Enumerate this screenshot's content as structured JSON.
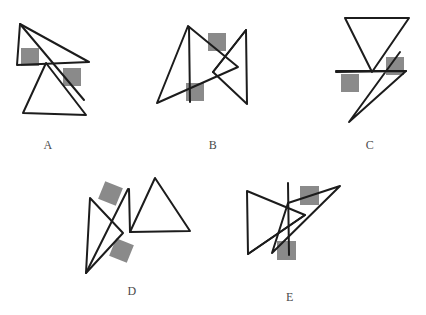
{
  "page": {
    "background_color": "#ffffff",
    "width": 426,
    "height": 315
  },
  "style": {
    "stroke_color": "#1c1c1c",
    "stroke_width": 2,
    "square_fill": "#8a8a8a",
    "label_color": "#4a4a4a"
  },
  "figures": [
    {
      "id": "A",
      "label": "A",
      "label_x": 38,
      "label_y": 138,
      "origin_x": 0,
      "origin_y": 0,
      "squares": [
        {
          "name": "square-upper-left",
          "x": 21,
          "y": 48,
          "size": 18,
          "rotation": 0
        },
        {
          "name": "square-lower-right",
          "x": 63,
          "y": 68,
          "size": 18,
          "rotation": 0
        }
      ],
      "strokes": [
        {
          "name": "upper-triangle",
          "points": "20,24 89,62 17,65 20,24"
        },
        {
          "name": "lower-triangle",
          "points": "46,63 23,113 86,115 46,63"
        },
        {
          "name": "long-diagonal",
          "points": "20,24 84,100"
        }
      ]
    },
    {
      "id": "B",
      "label": "B",
      "label_x": 207,
      "label_y": 138,
      "origin_x": 0,
      "origin_y": 0,
      "squares": [
        {
          "name": "square-upper",
          "x": 208,
          "y": 33,
          "size": 18,
          "rotation": 0
        },
        {
          "name": "square-lower",
          "x": 186,
          "y": 83,
          "size": 18,
          "rotation": 0
        }
      ],
      "strokes": [
        {
          "name": "left-triangle",
          "points": "188,26 157,103 238,67 188,26"
        },
        {
          "name": "right-triangle",
          "points": "246,30 213,72 247,104 246,30"
        },
        {
          "name": "vertical-line",
          "points": "189,27 190,102"
        },
        {
          "name": "right-upper-edge",
          "points": "213,72 246,30"
        }
      ]
    },
    {
      "id": "C",
      "label": "C",
      "label_x": 363,
      "label_y": 138,
      "origin_x": 0,
      "origin_y": 0,
      "squares": [
        {
          "name": "square-right",
          "x": 386,
          "y": 57,
          "size": 18,
          "rotation": 0
        },
        {
          "name": "square-left",
          "x": 341,
          "y": 74,
          "size": 18,
          "rotation": 0
        }
      ],
      "strokes": [
        {
          "name": "inverted-triangle",
          "points": "345,18 409,18 372,72 345,18"
        },
        {
          "name": "zigzag-lower",
          "points": "400,52 349,122 406,71 336,72"
        },
        {
          "name": "horizontal-line",
          "points": "336,71 406,71"
        }
      ]
    },
    {
      "id": "D",
      "label": "D",
      "label_x": 126,
      "label_y": 284,
      "origin_x": 0,
      "origin_y": 0,
      "squares": [
        {
          "name": "square-upper",
          "x": 101,
          "y": 184,
          "size": 19,
          "rotation": 22
        },
        {
          "name": "square-lower",
          "x": 112,
          "y": 241,
          "size": 19,
          "rotation": 22
        }
      ],
      "strokes": [
        {
          "name": "narrow-left-triangle",
          "points": "90,198 86,273 123,233 90,198"
        },
        {
          "name": "left-long-edge",
          "points": "86,273 128,189"
        },
        {
          "name": "right-triangle",
          "points": "155,178 130,232 190,231 155,178"
        },
        {
          "name": "right-vertical",
          "points": "129,189 130,232"
        }
      ]
    },
    {
      "id": "E",
      "label": "E",
      "label_x": 283,
      "label_y": 290,
      "origin_x": 0,
      "origin_y": 0,
      "squares": [
        {
          "name": "square-upper-right",
          "x": 300,
          "y": 186,
          "size": 19,
          "rotation": 0
        },
        {
          "name": "square-lower-left",
          "x": 277,
          "y": 241,
          "size": 19,
          "rotation": 0
        }
      ],
      "strokes": [
        {
          "name": "left-triangle",
          "points": "247,191 248,254 305,215 247,191"
        },
        {
          "name": "right-long-triangle",
          "points": "340,186 272,253 288,203 340,186"
        },
        {
          "name": "vertical-line",
          "points": "288,183 289,255"
        },
        {
          "name": "lower-left-edge",
          "points": "248,254 305,215"
        }
      ]
    }
  ]
}
